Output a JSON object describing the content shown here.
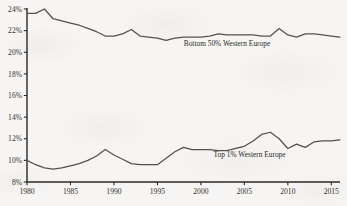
{
  "chart_data": {
    "type": "line",
    "title": "",
    "subtitle": "",
    "xlabel": "",
    "ylabel": "",
    "xlim": [
      1980,
      2016
    ],
    "ylim": [
      8,
      24
    ],
    "grid": false,
    "legend_position": "inline-annotation",
    "x_ticks": [
      "1980",
      "1985",
      "1990",
      "1995",
      "2000",
      "2005",
      "2010",
      "2015"
    ],
    "x_tick_values": [
      1980,
      1985,
      1990,
      1995,
      2000,
      2005,
      2010,
      2015
    ],
    "y_ticks": [
      "8%",
      "10%",
      "12%",
      "14%",
      "16%",
      "18%",
      "20%",
      "22%",
      "24%"
    ],
    "y_tick_values": [
      8,
      10,
      12,
      14,
      16,
      18,
      20,
      22,
      24
    ],
    "x": [
      1980,
      1981,
      1982,
      1983,
      1984,
      1985,
      1986,
      1987,
      1988,
      1989,
      1990,
      1991,
      1992,
      1993,
      1994,
      1995,
      1996,
      1997,
      1998,
      1999,
      2000,
      2001,
      2002,
      2003,
      2004,
      2005,
      2006,
      2007,
      2008,
      2009,
      2010,
      2011,
      2012,
      2013,
      2014,
      2015,
      2016
    ],
    "series": [
      {
        "name": "Bottom 50% Western Europe",
        "label": "Bottom 50% Western Europe",
        "label_x": 2003.0,
        "label_y": 20.55,
        "color": "#55514d",
        "values": [
          23.6,
          23.6,
          24.0,
          23.1,
          22.9,
          22.7,
          22.5,
          22.2,
          21.9,
          21.5,
          21.5,
          21.7,
          22.1,
          21.5,
          21.4,
          21.3,
          21.1,
          21.3,
          21.4,
          21.4,
          21.4,
          21.5,
          21.7,
          21.6,
          21.6,
          21.6,
          21.6,
          21.5,
          21.5,
          22.2,
          21.6,
          21.4,
          21.7,
          21.7,
          21.6,
          21.5,
          21.4
        ]
      },
      {
        "name": "Top 1% Western Europe",
        "label": "Top 1% Western Europe",
        "label_x": 2005.6,
        "label_y": 10.35,
        "color": "#55514d",
        "values": [
          10.0,
          9.6,
          9.3,
          9.2,
          9.3,
          9.5,
          9.7,
          10.0,
          10.4,
          11.0,
          10.5,
          10.1,
          9.7,
          9.6,
          9.6,
          9.6,
          10.2,
          10.8,
          11.2,
          11.0,
          11.0,
          11.0,
          10.9,
          10.9,
          11.1,
          11.3,
          11.8,
          12.4,
          12.6,
          12.0,
          11.1,
          11.5,
          11.2,
          11.7,
          11.8,
          11.8,
          11.9
        ]
      }
    ]
  }
}
